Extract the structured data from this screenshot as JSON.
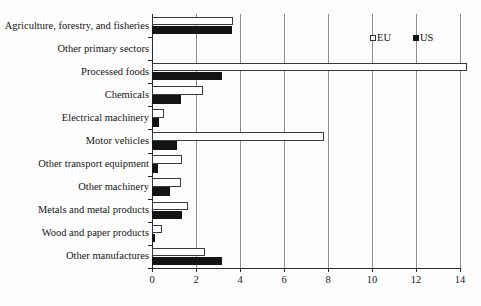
{
  "chart_data": {
    "type": "bar",
    "orientation": "horizontal",
    "title": "",
    "xlabel": "",
    "ylabel": "",
    "xlim": [
      0,
      14
    ],
    "xticks": [
      0,
      2,
      4,
      6,
      8,
      10,
      12,
      14
    ],
    "xtick_labels": [
      "0",
      "2",
      "4",
      "6",
      "8",
      "10",
      "12",
      "14"
    ],
    "grid": true,
    "grid_axis": "x",
    "legend_position": "top-right",
    "categories": [
      "Agriculture, forestry, and fisheries",
      "Other primary sectors",
      "Processed foods",
      "Chemicals",
      "Electrical machinery",
      "Motor vehicles",
      "Other transport equipment",
      "Other machinery",
      "Metals and metal products",
      "Wood and paper products",
      "Other manufactures"
    ],
    "series": [
      {
        "name": "EU",
        "color": "#ffffff",
        "edge_color": "#3a3a3a",
        "values": [
          3.7,
          0.03,
          14.3,
          2.3,
          0.55,
          7.8,
          1.35,
          1.3,
          1.65,
          0.45,
          2.4
        ]
      },
      {
        "name": "US",
        "color": "#141414",
        "edge_color": "#141414",
        "values": [
          3.65,
          0.02,
          3.2,
          1.3,
          0.3,
          1.15,
          0.25,
          0.8,
          1.35,
          0.15,
          3.2
        ]
      }
    ]
  },
  "legend": {
    "entries": [
      {
        "label": "EU",
        "marker": "hollow-square-marker"
      },
      {
        "label": "US",
        "marker": "filled-square-marker"
      }
    ]
  },
  "caption": {
    "text": ""
  }
}
